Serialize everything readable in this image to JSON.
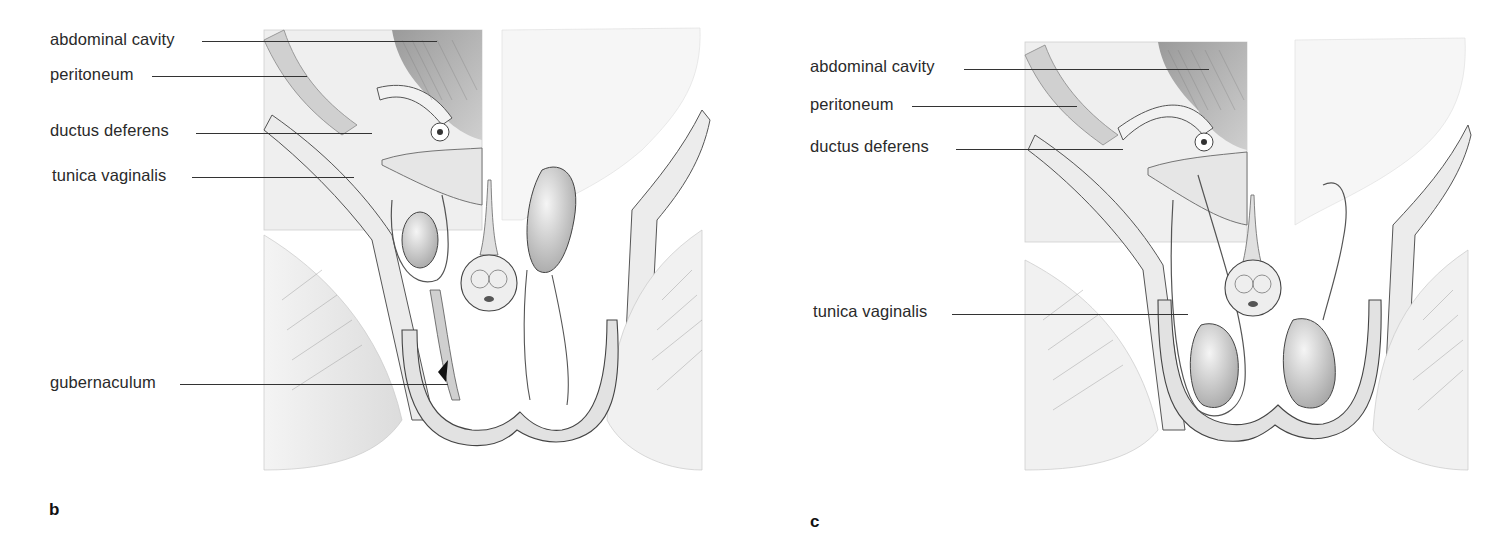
{
  "figure": {
    "panels": [
      {
        "id": "b",
        "letter": "b",
        "labels": [
          {
            "text": "abdominal cavity",
            "target": "abdominal cavity"
          },
          {
            "text": "peritoneum",
            "target": "peritoneum"
          },
          {
            "text": "ductus deferens",
            "target": "ductus deferens"
          },
          {
            "text": "tunica vaginalis",
            "target": "tunica vaginalis"
          },
          {
            "text": "gubernaculum",
            "target": "gubernaculum"
          }
        ]
      },
      {
        "id": "c",
        "letter": "c",
        "labels": [
          {
            "text": "abdominal cavity",
            "target": "abdominal cavity"
          },
          {
            "text": "peritoneum",
            "target": "peritoneum"
          },
          {
            "text": "ductus deferens",
            "target": "ductus deferens"
          },
          {
            "text": "tunica vaginalis",
            "target": "tunica vaginalis"
          }
        ]
      }
    ],
    "colors": {
      "ink": "#2a2a2a",
      "shade_dark": "#8a8a8a",
      "shade_light": "#d8d8d8",
      "background": "#ffffff"
    }
  }
}
